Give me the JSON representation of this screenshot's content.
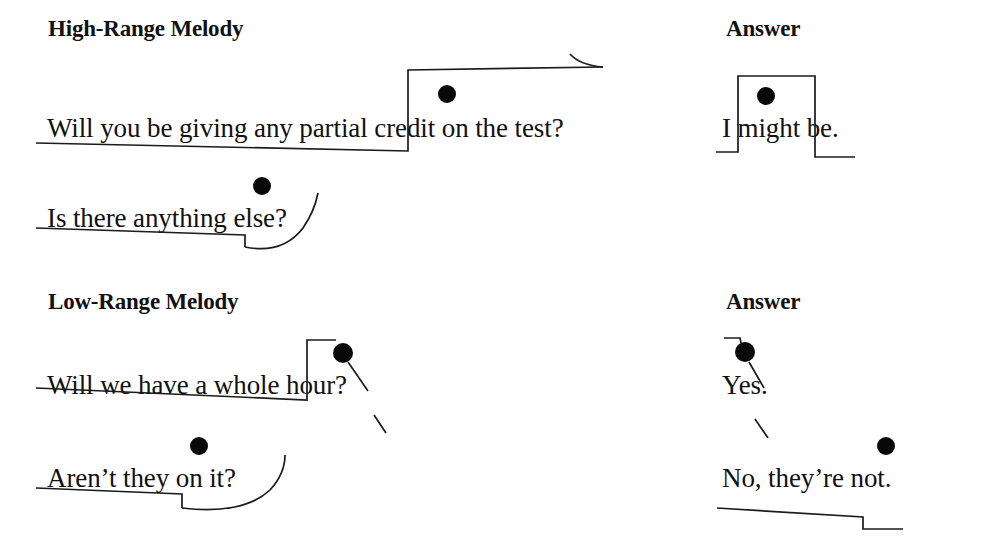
{
  "figure": {
    "type": "prosodic-contour-diagram",
    "background_color": "#ffffff",
    "ink_color": "#111111",
    "accent_dot_color": "#080808",
    "columns": [
      {
        "id": "stimulus",
        "heading_row1": "High-Range Melody",
        "heading_row2": "Low-Range Melody"
      },
      {
        "id": "answer",
        "heading_row1": "Answer",
        "heading_row2": "Answer"
      }
    ]
  },
  "headings": {
    "high_range_melody": "High-Range Melody",
    "answer_top": "Answer",
    "low_range_melody": "Low-Range Melody",
    "answer_bottom": "Answer"
  },
  "utterances": [
    {
      "id": "u1",
      "group": "high-range",
      "column": "stimulus",
      "text": "Will you be giving any partial credit on the test?",
      "accent_syllable": "cre-",
      "contour": "low-level then step up to high plateau with final rise",
      "final_tone": "rising"
    },
    {
      "id": "u2",
      "group": "high-range",
      "column": "answer",
      "text": "I might be.",
      "accent_syllable": "might",
      "contour": "low then step up over accent then step down to low",
      "final_tone": "low"
    },
    {
      "id": "u3",
      "group": "high-range",
      "column": "stimulus",
      "text": "Is there anything else?",
      "accent_syllable": "else",
      "contour": "low-level with small step down then final curved rise",
      "final_tone": "rising"
    },
    {
      "id": "u4",
      "group": "low-range",
      "column": "stimulus",
      "text": "Will we have a whole hour?",
      "accent_syllable": "hour",
      "contour": "low-level then step up to accent then falling",
      "final_tone": "falling"
    },
    {
      "id": "u5",
      "group": "low-range",
      "column": "answer",
      "text": "Yes.",
      "accent_syllable": "Yes",
      "contour": "short high onset then falling through accent",
      "final_tone": "falling"
    },
    {
      "id": "u6",
      "group": "low-range",
      "column": "stimulus",
      "text": "Aren’t they on it?",
      "accent_syllable": "on",
      "contour": "low-level with small step down then final curved rise",
      "final_tone": "rising"
    },
    {
      "id": "u7",
      "group": "low-range",
      "column": "answer",
      "text": "No, they’re not.",
      "accent_syllable": "not",
      "contour": "gently falling level then step down at end",
      "final_tone": "low"
    }
  ],
  "accent_dots": [
    {
      "for": "u1",
      "x": 447,
      "y": 94,
      "r": 9
    },
    {
      "for": "u2",
      "x": 766,
      "y": 96,
      "r": 9
    },
    {
      "for": "u3",
      "x": 262,
      "y": 186,
      "r": 9
    },
    {
      "for": "u4",
      "x": 343,
      "y": 353,
      "r": 10
    },
    {
      "for": "u5",
      "x": 745,
      "y": 352,
      "r": 10
    },
    {
      "for": "u6",
      "x": 199,
      "y": 446,
      "r": 9
    },
    {
      "for": "u7",
      "x": 886,
      "y": 446,
      "r": 9
    }
  ]
}
